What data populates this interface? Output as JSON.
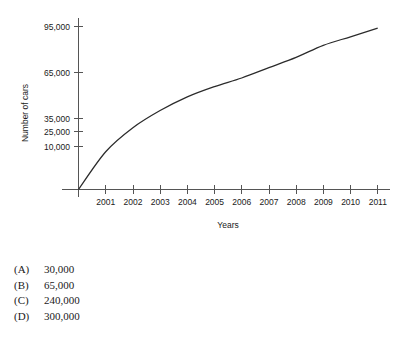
{
  "chart_data": {
    "type": "line",
    "title": "",
    "xlabel": "Years",
    "ylabel": "Number of cars",
    "x_tick_labels": [
      "2001",
      "2002",
      "2003",
      "2004",
      "2005",
      "2006",
      "2007",
      "2008",
      "2009",
      "2010",
      "2011"
    ],
    "y_tick_labels": [
      "10,000",
      "25,000",
      "35,000",
      "65,000",
      "95,000"
    ],
    "y_tick_values": [
      10000,
      25000,
      35000,
      65000,
      95000
    ],
    "grid": false,
    "legend": null,
    "series": [
      {
        "name": "Number of cars",
        "x": [
          "2000",
          "2001",
          "2002",
          "2003",
          "2004",
          "2005",
          "2006",
          "2007",
          "2008",
          "2009",
          "2010",
          "2011"
        ],
        "values": [
          0,
          22000,
          36000,
          46000,
          54000,
          60000,
          65000,
          71000,
          77000,
          84000,
          89000,
          94000
        ]
      }
    ],
    "xlim": [
      "2000",
      "2011"
    ],
    "ylim": [
      0,
      95000
    ],
    "note": "Monotonically increasing concave curve rising from the origin at 2000 to about 94,000 at 2011"
  },
  "choices": [
    {
      "letter": "(A)",
      "value": "30,000"
    },
    {
      "letter": "(B)",
      "value": "65,000"
    },
    {
      "letter": "(C)",
      "value": "240,000"
    },
    {
      "letter": "(D)",
      "value": "300,000"
    }
  ]
}
